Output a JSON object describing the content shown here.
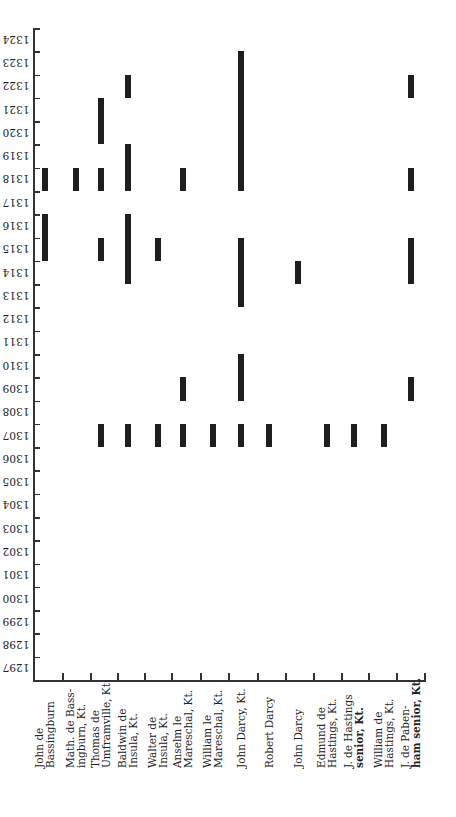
{
  "chart_data": {
    "type": "bar",
    "subtype": "gantt-like vertical range bars (service periods by year)",
    "title": "",
    "xlabel": "",
    "ylabel": "",
    "orientation_note": "Year labels printed rotated 180°",
    "ylim": [
      1297,
      1325
    ],
    "y_tick_labels": [
      "1297",
      "1298",
      "1299",
      "1300",
      "1301",
      "1302",
      "1303",
      "1304",
      "1305",
      "1306",
      "1307",
      "1308",
      "1309",
      "1310",
      "1311",
      "1312",
      "1313",
      "1314",
      "1315",
      "1316",
      "1317",
      "1318",
      "1319",
      "1320",
      "1321",
      "1322",
      "1323",
      "1324"
    ],
    "grid": false,
    "legend": null,
    "categories": [
      "John de Bassingburn",
      "Math. de Bassingburn, Kt.",
      "Thomas de Umframville, Kt.",
      "Baldwin de Insula, Kt.",
      "Walter de Insula, Kt.",
      "Anselm le Mareschal, Kt.",
      "William le Mareschal, Kt.",
      "John Darcy, Kt.",
      "Robert Darcy",
      "John Darcy",
      "Edmund de Hastings, Kt.",
      "J. de Hastings senior, Kt.",
      "William de Hastings, Kt.",
      "J. de Pabenham senior, Kt."
    ],
    "category_label_lines": [
      [
        "John de",
        "Bassingburn"
      ],
      [
        "Math. de Bass-",
        "ingburn, Kt."
      ],
      [
        "Thomas de",
        "Umframville, Kt."
      ],
      [
        "Baldwin de",
        "Insula, Kt."
      ],
      [
        "Walter de",
        "Insula, Kt."
      ],
      [
        "Anselm le",
        "Mareschal, Kt."
      ],
      [
        "William le",
        "Mareschal, Kt."
      ],
      [
        "John Darcy, Kt."
      ],
      [
        "Robert Darcy"
      ],
      [
        "John Darcy"
      ],
      [
        "Edmund de",
        "Hastings, Kt."
      ],
      [
        "J. de Hastings",
        "senior, Kt."
      ],
      [
        "William de",
        "Hastings, Kt."
      ],
      [
        "J. de Paben-",
        "ham senior, Kt."
      ]
    ],
    "series": [
      {
        "name": "John de Bassingburn",
        "ranges": [
          [
            1315,
            1316
          ],
          [
            1318,
            1318
          ]
        ]
      },
      {
        "name": "Math. de Bassingburn, Kt.",
        "ranges": [
          [
            1318,
            1318
          ]
        ]
      },
      {
        "name": "Thomas de Umframville, Kt.",
        "ranges": [
          [
            1307,
            1307
          ],
          [
            1315,
            1315
          ],
          [
            1318,
            1318
          ],
          [
            1320,
            1321
          ]
        ]
      },
      {
        "name": "Baldwin de Insula, Kt.",
        "ranges": [
          [
            1307,
            1307
          ],
          [
            1314,
            1316
          ],
          [
            1318,
            1319
          ],
          [
            1322,
            1322
          ]
        ]
      },
      {
        "name": "Walter de Insula, Kt.",
        "ranges": [
          [
            1307,
            1307
          ],
          [
            1315,
            1315
          ]
        ]
      },
      {
        "name": "Anselm le Mareschal, Kt.",
        "ranges": [
          [
            1307,
            1307
          ],
          [
            1309,
            1309
          ],
          [
            1318,
            1318
          ]
        ]
      },
      {
        "name": "William le Mareschal, Kt.",
        "ranges": [
          [
            1307,
            1307
          ]
        ]
      },
      {
        "name": "John Darcy, Kt.",
        "ranges": [
          [
            1307,
            1307
          ],
          [
            1309,
            1310
          ],
          [
            1313,
            1315
          ],
          [
            1318,
            1323
          ]
        ]
      },
      {
        "name": "Robert Darcy",
        "ranges": [
          [
            1307,
            1307
          ]
        ]
      },
      {
        "name": "John Darcy",
        "ranges": [
          [
            1314,
            1314
          ]
        ]
      },
      {
        "name": "Edmund de Hastings, Kt.",
        "ranges": [
          [
            1307,
            1307
          ]
        ]
      },
      {
        "name": "J. de Hastings senior, Kt.",
        "ranges": [
          [
            1307,
            1307
          ]
        ]
      },
      {
        "name": "William de Hastings, Kt.",
        "ranges": [
          [
            1307,
            1307
          ]
        ]
      },
      {
        "name": "J. de Pabenham senior, Kt.",
        "ranges": [
          [
            1309,
            1309
          ],
          [
            1314,
            1315
          ],
          [
            1318,
            1318
          ],
          [
            1322,
            1322
          ]
        ]
      }
    ],
    "colors": {
      "bar": "#1e1e1e",
      "axis": "#333333",
      "background": "#ffffff"
    }
  }
}
